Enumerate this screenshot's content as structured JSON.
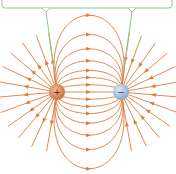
{
  "diagram": {
    "title": "Electric field lines between a positive and a negative charge",
    "colors": {
      "field_line": "#e07b3c",
      "callout": "#8ec98a",
      "positive_charge": "#c4703e",
      "negative_charge": "#7fa6c9",
      "background": "#ffffff"
    },
    "charges": [
      {
        "id": "positive",
        "sign": "+",
        "cx": 57,
        "cy": 92,
        "r": 8
      },
      {
        "id": "negative",
        "sign": "−",
        "cx": 121,
        "cy": 92,
        "r": 8
      }
    ],
    "callout": {
      "box": {
        "x": 2,
        "y": -10,
        "width": 170,
        "height": 18
      },
      "pointers": [
        {
          "x": 46,
          "y_end": 68
        },
        {
          "x": 132,
          "y_end": 68
        }
      ]
    },
    "field_lines": {
      "connecting_heights": [
        0,
        6,
        12,
        18,
        26,
        36,
        48,
        64,
        -6,
        -12,
        -18,
        -26,
        -36,
        -48,
        -64
      ],
      "outer_rays_angles_deg": [
        140,
        160,
        180,
        200,
        220,
        240,
        120,
        100
      ]
    }
  }
}
